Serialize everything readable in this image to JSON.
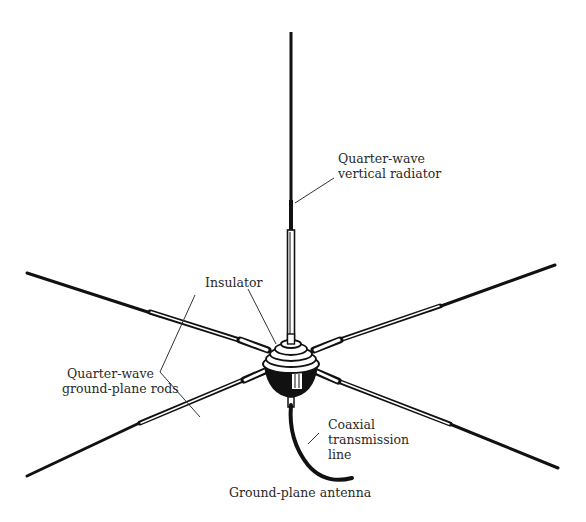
{
  "diagram": {
    "caption": "Ground-plane antenna",
    "labels": {
      "vertical_radiator": [
        "Quarter-wave",
        "vertical radiator"
      ],
      "insulator": "Insulator",
      "ground_plane_rods": [
        "Quarter-wave",
        "ground-plane rods"
      ],
      "coax": [
        "Coaxial",
        "transmission",
        "line"
      ]
    },
    "colors": {
      "ink": "#111111",
      "text": "#2a2a2a",
      "background": "#ffffff"
    }
  }
}
